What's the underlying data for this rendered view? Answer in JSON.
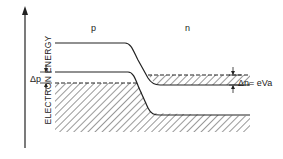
{
  "diagram": {
    "type": "band-diagram",
    "axis": {
      "label": "ELECTRON ENERGY"
    },
    "regions": {
      "p_label": "p",
      "n_label": "n"
    },
    "annotations": {
      "delta_p": "Δp",
      "delta_n": "Δn",
      "delta_n_equals": "= eVa"
    },
    "colors": {
      "line": "#222222",
      "background": "#ffffff"
    }
  }
}
